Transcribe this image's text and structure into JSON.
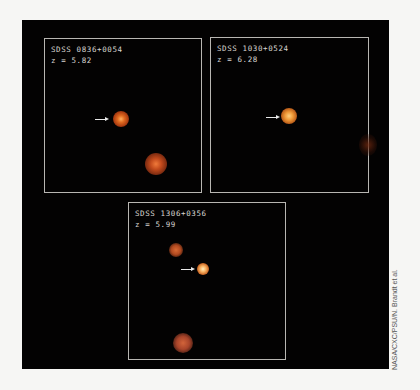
{
  "figure": {
    "panels": [
      {
        "name": "SDSS 0836+0054",
        "redshift": "z = 5.82"
      },
      {
        "name": "SDSS 1030+0524",
        "redshift": "z = 6.28"
      },
      {
        "name": "SDSS 1306+0356",
        "redshift": "z = 5.99"
      }
    ],
    "credit": "NASA/CXC/PSU/N. Brandt et al.",
    "colors": {
      "background": "#030202",
      "frame": "#b8b6b2",
      "source": "#d9671f"
    }
  }
}
